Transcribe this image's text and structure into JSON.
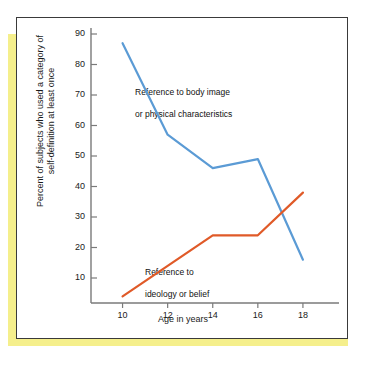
{
  "figure": {
    "accent_color": "#f5ef8c",
    "frame_color": "#3a3a3a",
    "caption_fragment_lines": [
      " ",
      " ",
      " ",
      " "
    ]
  },
  "chart_data": {
    "type": "line",
    "title": "",
    "xlabel": "Age in years",
    "ylabel": "Percent of subjects who used a category of\nself-definition at least once",
    "ylabel_line1": "Percent of subjects who used a category of",
    "ylabel_line2": "self-definition at least once",
    "x": [
      10,
      12,
      14,
      16,
      18
    ],
    "xtick_labels": [
      "10",
      "12",
      "14",
      "16",
      "18"
    ],
    "ytick_labels": [
      "10",
      "20",
      "30",
      "40",
      "50",
      "60",
      "70",
      "80",
      "90"
    ],
    "yticks": [
      10,
      20,
      30,
      40,
      50,
      60,
      70,
      80,
      90
    ],
    "xlim": [
      8.6,
      19.6
    ],
    "ylim": [
      0,
      90
    ],
    "grid": false,
    "legend_position": "inline-annotations",
    "series": [
      {
        "name": "Reference to body image or physical characteristics",
        "label_line1": "Reference to body image",
        "label_line2": "or physical characteristics",
        "color": "#5b9bd5",
        "values": [
          87,
          57,
          46,
          49,
          16
        ]
      },
      {
        "name": "Reference to ideology or belief",
        "label_line1": "Reference to",
        "label_line2": "ideology or belief",
        "color": "#e05a28",
        "values": [
          4,
          14,
          24,
          24,
          38
        ]
      }
    ]
  }
}
